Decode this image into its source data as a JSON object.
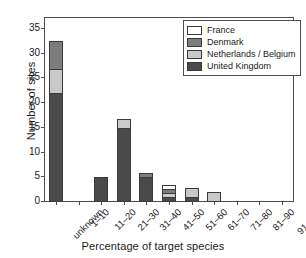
{
  "chart_data": {
    "type": "bar",
    "subtype": "stacked",
    "title": "",
    "xlabel": "Percentage of target species",
    "ylabel": "Number of sites",
    "categories": [
      "unknown",
      "1–10",
      "11–20",
      "21–30",
      "31–40",
      "41–50",
      "51–60",
      "61–70",
      "71–80",
      "81–90",
      "91–100"
    ],
    "ylim": [
      0,
      37
    ],
    "yticks": [
      0,
      5,
      10,
      15,
      20,
      25,
      30,
      35
    ],
    "grid": false,
    "legend_position": "top-right",
    "series": [
      {
        "name": "United Kingdom",
        "color": "#4a4a4a",
        "values": [
          22,
          0,
          5,
          15,
          5,
          1,
          1,
          0,
          0,
          0,
          0
        ]
      },
      {
        "name": "Netherlands / Belgium",
        "color": "#c9c9c9",
        "values": [
          5,
          0,
          0,
          2,
          0,
          1,
          2,
          2,
          0,
          0,
          0
        ]
      },
      {
        "name": "Denmark",
        "color": "#7d7d7d",
        "values": [
          6,
          0,
          0,
          0,
          1,
          1,
          0,
          0,
          0,
          0,
          0
        ]
      },
      {
        "name": "France",
        "color": "#ffffff",
        "values": [
          0,
          0,
          0,
          0,
          0,
          1,
          0,
          0,
          0,
          0,
          0
        ]
      }
    ],
    "totals": [
      33,
      0,
      5,
      17,
      6,
      4,
      3,
      2,
      0,
      0,
      0
    ],
    "stack_order_bottom_to_top": [
      "United Kingdom",
      "Netherlands / Belgium",
      "Denmark",
      "France"
    ]
  },
  "legend": {
    "entries": [
      {
        "label": "France",
        "color": "#ffffff"
      },
      {
        "label": "Denmark",
        "color": "#7d7d7d"
      },
      {
        "label": "Netherlands / Belgium",
        "color": "#c9c9c9"
      },
      {
        "label": "United Kingdom",
        "color": "#4a4a4a"
      }
    ]
  },
  "axis_colors": {
    "frame": "#4d4d4d",
    "text": "#1a1a1a",
    "bar_outline": "#3a3a3a"
  }
}
